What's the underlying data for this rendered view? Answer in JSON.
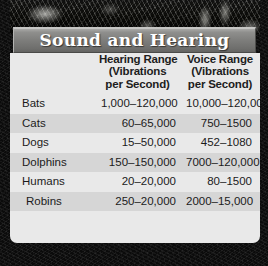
{
  "title": "Sound and Hearing",
  "table": {
    "headers": {
      "animal": "",
      "hearing": [
        "Hearing Range",
        "(Vibrations",
        "per Second)"
      ],
      "voice": [
        "Voice Range",
        "(Vibrations",
        "per Second)"
      ]
    },
    "rows": [
      {
        "animal": "Bats",
        "hearing": "1,000–120,000",
        "voice": "10,000–120,000"
      },
      {
        "animal": "Cats",
        "hearing": "60–65,000",
        "voice": "750–1500"
      },
      {
        "animal": "Dogs",
        "hearing": "15–50,000",
        "voice": "452–1080"
      },
      {
        "animal": "Dolphins",
        "hearing": "150–150,000",
        "voice": "7000–120,000"
      },
      {
        "animal": "Humans",
        "hearing": "20–20,000",
        "voice": "80–1500"
      },
      {
        "animal": "Robins",
        "hearing": "250–20,000",
        "voice": "2000–15,000"
      }
    ]
  },
  "colors": {
    "title_bar_top": "#a9a9a7",
    "title_bar_bottom": "#636361",
    "row_light": "#e9e9e9",
    "row_dark": "#d6d6d6",
    "text": "#1b1b1b",
    "backdrop": "#0b0b0b"
  }
}
